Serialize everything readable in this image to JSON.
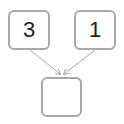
{
  "diagram": {
    "nodes": [
      {
        "id": "left",
        "label": "3"
      },
      {
        "id": "right",
        "label": "1"
      },
      {
        "id": "result",
        "label": ""
      }
    ],
    "edges": [
      {
        "from": "left",
        "to": "result"
      },
      {
        "from": "right",
        "to": "result"
      }
    ],
    "colors": {
      "border": "#a8a8a8",
      "arrow": "#a8a8a8",
      "text": "#222222"
    }
  }
}
